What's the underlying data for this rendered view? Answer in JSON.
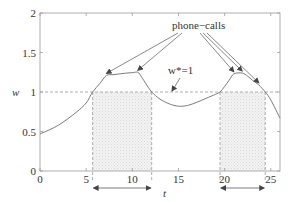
{
  "chart_data": {
    "type": "line",
    "title": "",
    "xlabel": "t",
    "ylabel": "w",
    "xlim": [
      0,
      26
    ],
    "ylim": [
      0,
      2
    ],
    "xticks": [
      0,
      5,
      10,
      15,
      20,
      25
    ],
    "xtick_labels": [
      "0",
      "5",
      "10",
      "15",
      "20",
      "25"
    ],
    "yticks": [
      0,
      0.5,
      1,
      1.5,
      2
    ],
    "ytick_labels": [
      "0",
      "0.5",
      "1",
      "1.5",
      "2"
    ],
    "grid": false,
    "legend": null,
    "series": [
      {
        "name": "w(t)",
        "x": [
          0,
          1,
          2,
          3,
          4,
          5,
          5.7,
          6.5,
          7.2,
          8,
          9,
          10,
          10.6,
          11,
          11.5,
          12.1,
          13,
          14,
          15,
          16,
          17,
          18,
          19,
          19.5,
          20,
          20.5,
          21,
          21.9,
          22.5,
          23,
          23.7,
          24.4,
          25,
          26
        ],
        "y": [
          0.47,
          0.52,
          0.58,
          0.66,
          0.75,
          0.86,
          1.0,
          1.11,
          1.21,
          1.22,
          1.235,
          1.245,
          1.25,
          1.19,
          1.1,
          1.0,
          0.91,
          0.85,
          0.82,
          0.83,
          0.87,
          0.92,
          0.97,
          1.0,
          1.07,
          1.15,
          1.23,
          1.24,
          1.2,
          1.15,
          1.09,
          1.0,
          0.9,
          0.67
        ]
      }
    ],
    "threshold": {
      "label": "w*=1",
      "value": 1,
      "style": "dashed"
    },
    "shaded_regions": [
      {
        "t_start": 5.7,
        "t_end": 12.1
      },
      {
        "t_start": 19.5,
        "t_end": 24.4
      }
    ],
    "event_markers": {
      "label": "phone−calls",
      "times": [
        7.2,
        10.6,
        21.0,
        21.9,
        23.7
      ]
    },
    "annotations": [
      {
        "text": "phone−calls",
        "x": 16.5,
        "y": 1.85
      },
      {
        "text": "w*=1",
        "x": 15.0,
        "y": 1.28
      }
    ],
    "interval_arrows": [
      {
        "from": 5.7,
        "to": 12.1
      },
      {
        "from": 19.5,
        "to": 24.4
      }
    ]
  },
  "labels": {
    "x_axis": "t",
    "y_axis": "w",
    "phone_calls": "phone−calls",
    "threshold": "w*=1"
  },
  "colors": {
    "curve": "#7a7a7a",
    "axis": "#9a9a9a",
    "dashed": "#9a9a9a",
    "shade": "#ececec",
    "text": "#333333"
  }
}
